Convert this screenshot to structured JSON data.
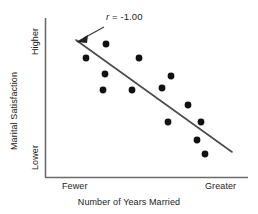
{
  "figure": {
    "background_color": "#ffffff",
    "point_color": "#111111",
    "line_color": "#4a4a4a",
    "axis_color": "#6b6b6b"
  },
  "annotation": {
    "symbol": "r",
    "rest": " = -1.00",
    "full_text": "r = -1.00",
    "arrow_name": "annotation-arrow"
  },
  "axes": {
    "x_title": "Number of Years Married",
    "x_low_label": "Fewer",
    "x_high_label": "Greater",
    "y_title": "Marital Satisfaction",
    "y_high_label": "Higher",
    "y_low_label": "Lower"
  },
  "chart_data": {
    "type": "scatter",
    "title": "",
    "subtitle": "",
    "xlabel": "Number of Years Married",
    "ylabel": "Marital Satisfaction",
    "xlim": [
      0,
      1
    ],
    "ylim": [
      0,
      1
    ],
    "x_tick_labels": [
      "Fewer",
      "Greater"
    ],
    "y_tick_labels": [
      "Lower",
      "Higher"
    ],
    "grid": false,
    "legend": null,
    "annotations": [
      {
        "text": "r = -1.00",
        "x_px": 106,
        "y_px": 12,
        "arrow_from_px": [
          104,
          28
        ],
        "arrow_to_px": [
          78,
          42
        ]
      }
    ],
    "correlation_r": -1.0,
    "n_points": 13,
    "points_px": [
      [
        106,
        44
      ],
      [
        86,
        58
      ],
      [
        139,
        58
      ],
      [
        105,
        74
      ],
      [
        171,
        76
      ],
      [
        103,
        90
      ],
      [
        132,
        90
      ],
      [
        162,
        88
      ],
      [
        188,
        105
      ],
      [
        168,
        122
      ],
      [
        201,
        122
      ],
      [
        197,
        140
      ],
      [
        205,
        154
      ]
    ],
    "fit_line_px": {
      "x1": 76,
      "y1": 40,
      "x2": 232,
      "y2": 152
    },
    "plot_box_px": {
      "left": 45,
      "top": 18,
      "right": 248,
      "bottom": 177
    }
  }
}
